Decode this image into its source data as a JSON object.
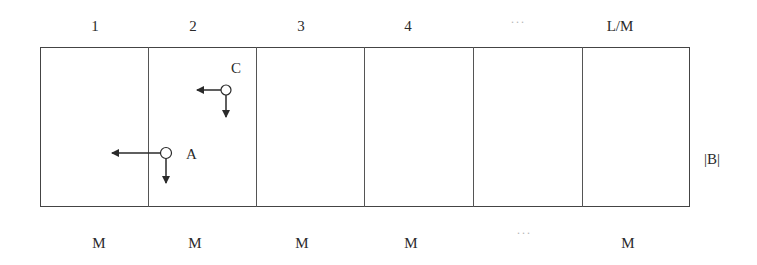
{
  "diagram": {
    "top_labels": [
      "1",
      "2",
      "3",
      "4",
      "···",
      "L/M"
    ],
    "bottom_labels": [
      "M",
      "M",
      "M",
      "M",
      "···",
      "M"
    ],
    "side_label": "|B|",
    "points": [
      {
        "name": "C",
        "cell": 2,
        "arrows": [
          "left",
          "down"
        ]
      },
      {
        "name": "A",
        "cell": 2,
        "arrows": [
          "left (long, crossing into cell 1)",
          "down"
        ]
      }
    ],
    "colors": {
      "line": "#444444",
      "text": "#2a2a2a",
      "dots": "#b5b5b5"
    }
  }
}
